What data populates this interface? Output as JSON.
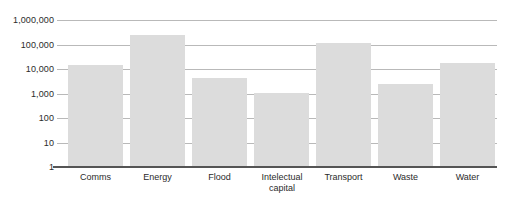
{
  "chart_data": {
    "type": "bar",
    "title": "",
    "subtitle": "",
    "xlabel": "",
    "ylabel": "",
    "scale": "log",
    "grid": true,
    "legend": "none",
    "ylim": [
      1,
      1000000
    ],
    "categories": [
      "Comms",
      "Energy",
      "Flood",
      "Intelectual capital",
      "Transport",
      "Waste",
      "Water"
    ],
    "values": [
      15000,
      250000,
      4500,
      1100,
      120000,
      2500,
      18000
    ],
    "ytick_labels": [
      "1",
      "10",
      "100",
      "1,000",
      "10,000",
      "100,000",
      "1,000,000"
    ],
    "ytick_values": [
      1,
      10,
      100,
      1000,
      10000,
      100000,
      1000000
    ],
    "bar_color": "#dcdcdc",
    "gridline_color": "#b9b9b9",
    "axis_color": "#555555",
    "background_color": "#ffffff",
    "text_color": "#2b2b2b"
  },
  "x_label_lines": [
    [
      "Comms"
    ],
    [
      "Energy"
    ],
    [
      "Flood"
    ],
    [
      "Intelectual",
      "capital"
    ],
    [
      "Transport"
    ],
    [
      "Waste"
    ],
    [
      "Water"
    ]
  ]
}
